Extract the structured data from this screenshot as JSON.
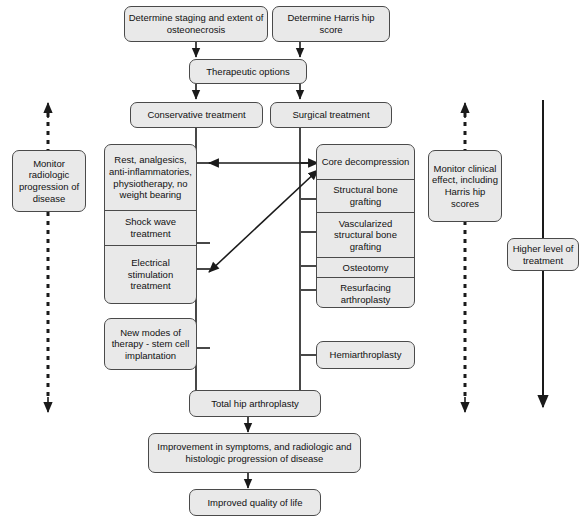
{
  "diagram": {
    "colors": {
      "node_fill": "#e9e9e9",
      "node_border": "#4a4a4a",
      "line": "#1a1a1a",
      "background": "#ffffff"
    },
    "nodes": {
      "determine_staging": "Determine staging and extent of osteonecrosis",
      "determine_harris": "Determine Harris hip score",
      "therapeutic_options": "Therapeutic options",
      "conservative_treatment": "Conservative treatment",
      "surgical_treatment": "Surgical treatment",
      "rest_analgesics": "Rest, analgesics, anti-inflammatories, physiotherapy, no weight bearing",
      "shock_wave": "Shock wave treatment",
      "electrical_stimulation": "Electrical stimulation treatment",
      "new_modes": "New modes of therapy - stem cell implantation",
      "core_decompression": "Core decompression",
      "structural_bone_grafting": "Structural bone grafting",
      "vascularized_grafting": "Vascularized structural bone grafting",
      "osteotomy": "Osteotomy",
      "resurfacing_arthroplasty": "Resurfacing arthroplasty",
      "hemiarthroplasty": "Hemiarthroplasty",
      "total_hip_arthroplasty": "Total hip arthroplasty",
      "improvement": "Improvement in symptoms, and radiologic and histologic progression of disease",
      "improved_quality": "Improved quality of life",
      "monitor_radiologic": "Monitor radiologic progression of disease",
      "monitor_clinical": "Monitor clinical effect, including Harris hip scores",
      "higher_level": "Higher level of treatment"
    },
    "conservative_stack": [
      {
        "id": "rest_analgesics",
        "label": "Rest, analgesics, anti-inflammatories, physiotherapy, no weight bearing"
      },
      {
        "id": "shock_wave",
        "label": "Shock wave treatment"
      },
      {
        "id": "electrical_stimulation",
        "label": "Electrical stimulation treatment"
      }
    ],
    "surgical_stack": [
      {
        "id": "core_decompression",
        "label": "Core decompression"
      },
      {
        "id": "structural_bone_grafting",
        "label": "Structural bone grafting"
      },
      {
        "id": "vascularized_grafting",
        "label": "Vascularized structural bone grafting"
      },
      {
        "id": "osteotomy",
        "label": "Osteotomy"
      },
      {
        "id": "resurfacing_arthroplasty",
        "label": "Resurfacing arthroplasty"
      }
    ],
    "side_annotations": {
      "left_dashed_axis": "Monitor radiologic progression of disease",
      "right_dashed_axis": "Monitor clinical effect, including Harris hip scores",
      "right_solid_axis": "Higher level of treatment"
    }
  }
}
